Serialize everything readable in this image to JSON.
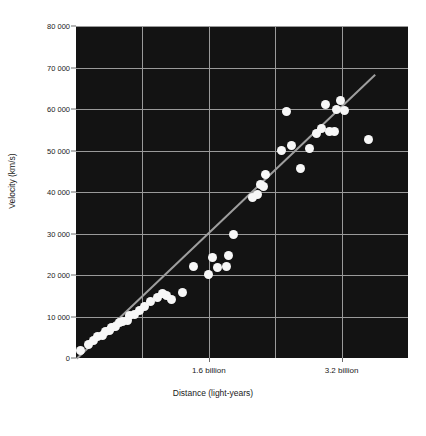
{
  "chart_data": {
    "type": "scatter",
    "title": "",
    "subtitle": "",
    "xlabel": "Distance (light-years)",
    "ylabel": "Velocity (km/s)",
    "xlim": [
      0,
      4000000000
    ],
    "ylim": [
      0,
      80000
    ],
    "grid": true,
    "legend": null,
    "background": "#131313",
    "marker_color": "#f7f7f7",
    "grid_color": "#9a9a9a",
    "trendline_color": "#9e9e9e",
    "y_ticks": [
      0,
      10000,
      20000,
      30000,
      40000,
      50000,
      60000,
      70000,
      80000
    ],
    "y_tick_labels": [
      "0",
      "10 000",
      "20 000",
      "30 000",
      "40 000",
      "50 000",
      "60 000",
      "70 000",
      "80 000"
    ],
    "x_ticks": [
      1600000000,
      3200000000
    ],
    "x_tick_labels": [
      "1.6 billion",
      "3.2 billion"
    ],
    "x_gridlines": [
      800000000,
      1600000000,
      2400000000,
      3200000000
    ],
    "trendline": {
      "x_start": 0,
      "y_start": 0,
      "x_end": 3600000000,
      "y_end": 68500
    },
    "points": [
      {
        "x": 60000000,
        "y": 1800
      },
      {
        "x": 150000000,
        "y": 3300
      },
      {
        "x": 210000000,
        "y": 4200
      },
      {
        "x": 260000000,
        "y": 5200
      },
      {
        "x": 320000000,
        "y": 5400
      },
      {
        "x": 350000000,
        "y": 6400
      },
      {
        "x": 400000000,
        "y": 6700
      },
      {
        "x": 430000000,
        "y": 7400
      },
      {
        "x": 480000000,
        "y": 7600
      },
      {
        "x": 520000000,
        "y": 8600
      },
      {
        "x": 560000000,
        "y": 8800
      },
      {
        "x": 620000000,
        "y": 9100
      },
      {
        "x": 650000000,
        "y": 10200
      },
      {
        "x": 700000000,
        "y": 10500
      },
      {
        "x": 760000000,
        "y": 11400
      },
      {
        "x": 820000000,
        "y": 12400
      },
      {
        "x": 900000000,
        "y": 13600
      },
      {
        "x": 980000000,
        "y": 14600
      },
      {
        "x": 1040000000,
        "y": 15600
      },
      {
        "x": 1090000000,
        "y": 15100
      },
      {
        "x": 1150000000,
        "y": 14100
      },
      {
        "x": 1280000000,
        "y": 15700
      },
      {
        "x": 1420000000,
        "y": 22100
      },
      {
        "x": 1600000000,
        "y": 20100
      },
      {
        "x": 1640000000,
        "y": 24200
      },
      {
        "x": 1700000000,
        "y": 21700
      },
      {
        "x": 1810000000,
        "y": 22100
      },
      {
        "x": 1840000000,
        "y": 24700
      },
      {
        "x": 1900000000,
        "y": 29700
      },
      {
        "x": 2130000000,
        "y": 38600
      },
      {
        "x": 2190000000,
        "y": 39400
      },
      {
        "x": 2220000000,
        "y": 41700
      },
      {
        "x": 2260000000,
        "y": 41300
      },
      {
        "x": 2280000000,
        "y": 44100
      },
      {
        "x": 2470000000,
        "y": 50100
      },
      {
        "x": 2540000000,
        "y": 59400
      },
      {
        "x": 2600000000,
        "y": 51100
      },
      {
        "x": 2700000000,
        "y": 45600
      },
      {
        "x": 2810000000,
        "y": 50500
      },
      {
        "x": 2900000000,
        "y": 54100
      },
      {
        "x": 2960000000,
        "y": 55200
      },
      {
        "x": 3010000000,
        "y": 61200
      },
      {
        "x": 3060000000,
        "y": 54600
      },
      {
        "x": 3120000000,
        "y": 54600
      },
      {
        "x": 3140000000,
        "y": 59900
      },
      {
        "x": 3190000000,
        "y": 62000
      },
      {
        "x": 3230000000,
        "y": 59700
      },
      {
        "x": 3530000000,
        "y": 52600
      }
    ]
  },
  "figure": {
    "x_axis_title": "Distance (light-years)",
    "y_axis_title": "Velocity (km/s)"
  }
}
